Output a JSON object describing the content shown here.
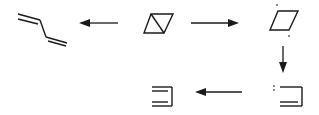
{
  "diagram": {
    "type": "reaction-scheme",
    "colors": {
      "stroke": "#1a1a1a",
      "background": "#ffffff"
    },
    "nodes": [
      {
        "id": "butadiene",
        "label": "1,3-butadiene (skeletal)"
      },
      {
        "id": "bicyclobutane",
        "label": "bicyclo[1.1.0]butane (skeletal)"
      },
      {
        "id": "diradical",
        "label": "cyclobutane-1,3-diyl (parallelogram with radical dots)"
      },
      {
        "id": "carbene",
        "label": "carbene intermediate (bracket with lone pair)"
      },
      {
        "id": "alkene-product",
        "label": "triple-line skeletal product"
      }
    ],
    "edges": [
      {
        "from": "bicyclobutane",
        "to": "butadiene",
        "direction": "left"
      },
      {
        "from": "bicyclobutane",
        "to": "diradical",
        "direction": "right"
      },
      {
        "from": "diradical",
        "to": "carbene",
        "direction": "down"
      },
      {
        "from": "carbene",
        "to": "alkene-product",
        "direction": "left"
      }
    ],
    "annotations": {
      "radical_dots": "·",
      "lone_pair": ":"
    }
  }
}
